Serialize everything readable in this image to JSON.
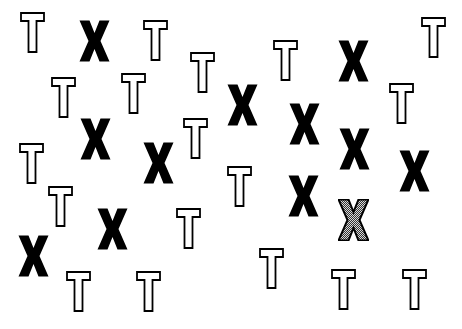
{
  "stimulus": {
    "background": "#ffffff",
    "distractor_letter": "T",
    "target_letter": "X",
    "colors": {
      "outline": "#000000",
      "fill_solid": "#000000",
      "fill_hatched": "#9a9a9a"
    },
    "items": [
      {
        "letter": "T",
        "style": "outline",
        "x": 20,
        "y": 12,
        "w": 25,
        "h": 41
      },
      {
        "letter": "X",
        "style": "solid",
        "x": 79,
        "y": 20,
        "w": 31,
        "h": 42
      },
      {
        "letter": "T",
        "style": "outline",
        "x": 143,
        "y": 20,
        "w": 25,
        "h": 41
      },
      {
        "letter": "T",
        "style": "outline",
        "x": 190,
        "y": 52,
        "w": 25,
        "h": 41
      },
      {
        "letter": "T",
        "style": "outline",
        "x": 273,
        "y": 40,
        "w": 25,
        "h": 41
      },
      {
        "letter": "X",
        "style": "solid",
        "x": 338,
        "y": 40,
        "w": 31,
        "h": 42
      },
      {
        "letter": "T",
        "style": "outline",
        "x": 421,
        "y": 17,
        "w": 25,
        "h": 41
      },
      {
        "letter": "T",
        "style": "outline",
        "x": 51,
        "y": 77,
        "w": 25,
        "h": 41
      },
      {
        "letter": "T",
        "style": "outline",
        "x": 121,
        "y": 73,
        "w": 25,
        "h": 41
      },
      {
        "letter": "X",
        "style": "solid",
        "x": 227,
        "y": 84,
        "w": 31,
        "h": 42
      },
      {
        "letter": "X",
        "style": "solid",
        "x": 289,
        "y": 103,
        "w": 31,
        "h": 42
      },
      {
        "letter": "T",
        "style": "outline",
        "x": 389,
        "y": 83,
        "w": 25,
        "h": 41
      },
      {
        "letter": "X",
        "style": "solid",
        "x": 80,
        "y": 118,
        "w": 31,
        "h": 42
      },
      {
        "letter": "T",
        "style": "outline",
        "x": 183,
        "y": 118,
        "w": 25,
        "h": 41
      },
      {
        "letter": "X",
        "style": "solid",
        "x": 339,
        "y": 128,
        "w": 31,
        "h": 42
      },
      {
        "letter": "T",
        "style": "outline",
        "x": 19,
        "y": 143,
        "w": 25,
        "h": 41
      },
      {
        "letter": "X",
        "style": "solid",
        "x": 143,
        "y": 142,
        "w": 31,
        "h": 42
      },
      {
        "letter": "X",
        "style": "solid",
        "x": 399,
        "y": 150,
        "w": 31,
        "h": 42
      },
      {
        "letter": "T",
        "style": "outline",
        "x": 227,
        "y": 166,
        "w": 25,
        "h": 41
      },
      {
        "letter": "X",
        "style": "solid",
        "x": 288,
        "y": 175,
        "w": 31,
        "h": 42
      },
      {
        "letter": "T",
        "style": "outline",
        "x": 48,
        "y": 186,
        "w": 25,
        "h": 41
      },
      {
        "letter": "X",
        "style": "hatched",
        "x": 338,
        "y": 199,
        "w": 31,
        "h": 42
      },
      {
        "letter": "X",
        "style": "solid",
        "x": 97,
        "y": 208,
        "w": 31,
        "h": 42
      },
      {
        "letter": "T",
        "style": "outline",
        "x": 176,
        "y": 208,
        "w": 25,
        "h": 41
      },
      {
        "letter": "X",
        "style": "solid",
        "x": 18,
        "y": 235,
        "w": 31,
        "h": 42
      },
      {
        "letter": "T",
        "style": "outline",
        "x": 259,
        "y": 248,
        "w": 25,
        "h": 41
      },
      {
        "letter": "T",
        "style": "outline",
        "x": 66,
        "y": 271,
        "w": 25,
        "h": 41
      },
      {
        "letter": "T",
        "style": "outline",
        "x": 136,
        "y": 271,
        "w": 25,
        "h": 41
      },
      {
        "letter": "T",
        "style": "outline",
        "x": 331,
        "y": 269,
        "w": 25,
        "h": 41
      },
      {
        "letter": "T",
        "style": "outline",
        "x": 402,
        "y": 269,
        "w": 25,
        "h": 41
      }
    ]
  }
}
